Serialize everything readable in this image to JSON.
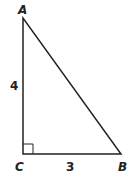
{
  "diagram": {
    "type": "right-triangle",
    "vertices": {
      "A": {
        "label": "A",
        "x": 23,
        "y": 18
      },
      "B": {
        "label": "B",
        "x": 121,
        "y": 154
      },
      "C": {
        "label": "C",
        "x": 23,
        "y": 154
      }
    },
    "sides": {
      "AC": {
        "label": "4"
      },
      "CB": {
        "label": "3"
      }
    },
    "right_angle_at": "C",
    "stroke_color": "#222222"
  }
}
